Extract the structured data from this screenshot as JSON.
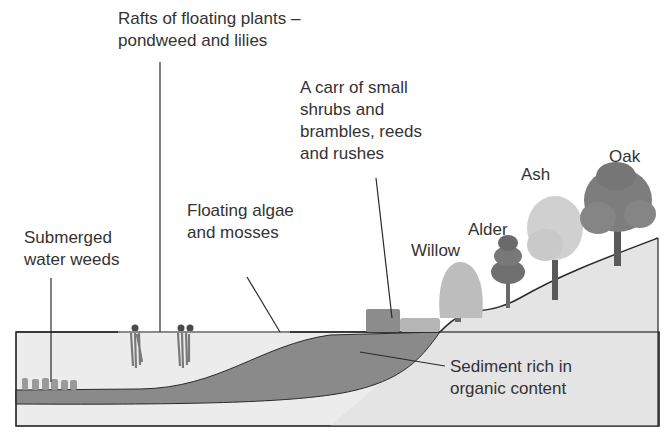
{
  "labels": {
    "rafts": [
      "Rafts of floating plants –",
      "pondweed and lilies"
    ],
    "carr": [
      "A carr of small",
      "shrubs and",
      "brambles, reeds",
      "and rushes"
    ],
    "algae": [
      "Floating algae",
      "and mosses"
    ],
    "submerged": [
      "Submerged",
      "water weeds"
    ],
    "sediment": [
      "Sediment rich in",
      "organic content"
    ],
    "willow": "Willow",
    "alder": "Alder",
    "ash": "Ash",
    "oak": "Oak"
  },
  "colors": {
    "water": "#ececec",
    "sediment": "#8a8a8a",
    "land": "#e4e4e4",
    "outline": "#2a2a2a",
    "oak": "#7d7d7d",
    "ash": "#d0d0d0",
    "alder": "#6f6f6f",
    "willow": "#bdbdbd"
  }
}
